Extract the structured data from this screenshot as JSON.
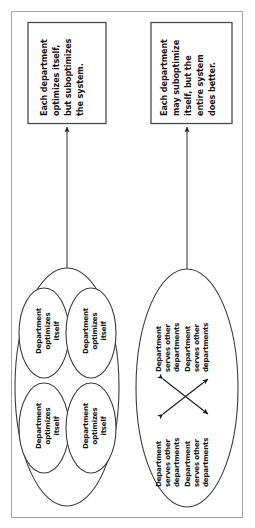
{
  "figure": {
    "orientation": "rotated-90-counterclockwise",
    "colors": {
      "ink": "#141414",
      "stroke": "#3a3a3a",
      "frame": "#9a9a9a",
      "background": "#ffffff"
    },
    "frame": {
      "label": "page-frame"
    }
  },
  "panels": [
    {
      "id": "left",
      "callout": {
        "label": "Each department optimizes itself, but suboptimizes the system.",
        "lines": [
          "Each department",
          "optimizes itself,",
          "but suboptimizes",
          "the system."
        ]
      },
      "group": {
        "label": "Silo organization",
        "nodes": [
          {
            "lines": [
              "Department",
              "optimizes",
              "itself"
            ]
          },
          {
            "lines": [
              "Department",
              "optimizes",
              "itself"
            ]
          },
          {
            "lines": [
              "Department",
              "optimizes",
              "itself"
            ]
          },
          {
            "lines": [
              "Department",
              "optimizes",
              "itself"
            ]
          }
        ]
      }
    },
    {
      "id": "right",
      "callout": {
        "label": "Each department may suboptimize itself, but the entire system does better.",
        "lines": [
          "Each department",
          "may suboptimize",
          "itself, but the",
          "entire system",
          "does better."
        ]
      },
      "group": {
        "label": "Interdependent organization",
        "nodes": [
          {
            "lines": [
              "Department",
              "serves other",
              "departments"
            ]
          },
          {
            "lines": [
              "Department",
              "serves other",
              "departments"
            ]
          },
          {
            "lines": [
              "Department",
              "serves other",
              "departments"
            ]
          },
          {
            "lines": [
              "Department",
              "serves other",
              "departments"
            ]
          }
        ],
        "connectors": [
          {
            "label": "cross-link-a",
            "type": "double-headed-arrow"
          },
          {
            "label": "cross-link-b",
            "type": "double-headed-arrow"
          }
        ]
      }
    }
  ]
}
